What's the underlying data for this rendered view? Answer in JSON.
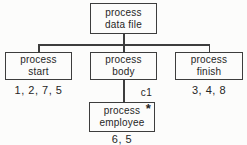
{
  "diagram": {
    "type": "structure-chart",
    "nodes": {
      "root": {
        "label": "process\ndata file"
      },
      "start": {
        "label": "process\nstart",
        "numbers": "1, 2, 7, 5"
      },
      "body": {
        "label": "process\nbody"
      },
      "finish": {
        "label": "process\nfinish",
        "numbers": "3, 4, 8"
      },
      "employee": {
        "label": "process\nemployee",
        "marker": "*",
        "numbers": "6, 5"
      }
    },
    "connector_label": "c1",
    "colors": {
      "line": "#3d3d3d",
      "text": "#262626",
      "background": "#fcfcfb"
    }
  }
}
